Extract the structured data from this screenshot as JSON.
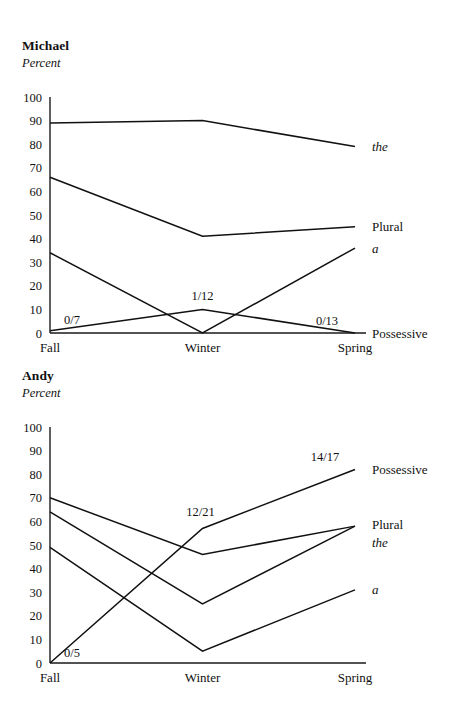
{
  "figure": {
    "panels": [
      {
        "id": "michael",
        "title": "Michael",
        "subtitle": "Percent"
      },
      {
        "id": "andy",
        "title": "Andy",
        "subtitle": "Percent"
      }
    ]
  },
  "chart_data": [
    {
      "type": "line",
      "title": "Michael",
      "subtitle": "Percent",
      "xlabel": "",
      "ylabel": "Percent",
      "categories": [
        "Fall",
        "Winter",
        "Spring"
      ],
      "ylim": [
        0,
        100
      ],
      "yticks": [
        0,
        10,
        20,
        30,
        40,
        50,
        60,
        70,
        80,
        90,
        100
      ],
      "ytick_labels": [
        "0",
        "10",
        "20",
        "30",
        "40",
        "50",
        "60",
        "70",
        "80",
        "90",
        "100"
      ],
      "grid": false,
      "legend_position": "right-inline",
      "series": [
        {
          "name": "the",
          "style": "italic",
          "values": [
            89,
            90,
            79
          ]
        },
        {
          "name": "Plural",
          "style": "roman",
          "values": [
            66,
            41,
            45
          ]
        },
        {
          "name": "a",
          "style": "italic",
          "values": [
            34,
            0,
            36
          ]
        },
        {
          "name": "Possessive",
          "style": "roman",
          "values": [
            1,
            10,
            0
          ]
        }
      ],
      "annotations": [
        {
          "text": "0/7",
          "category": "Fall",
          "value": 1,
          "series": "Possessive"
        },
        {
          "text": "1/12",
          "category": "Winter",
          "value": 10,
          "series": "Possessive"
        },
        {
          "text": "0/13",
          "category": "Spring",
          "value": 0,
          "series": "Possessive"
        }
      ]
    },
    {
      "type": "line",
      "title": "Andy",
      "subtitle": "Percent",
      "xlabel": "",
      "ylabel": "Percent",
      "categories": [
        "Fall",
        "Winter",
        "Spring"
      ],
      "ylim": [
        0,
        100
      ],
      "yticks": [
        0,
        10,
        20,
        30,
        40,
        50,
        60,
        70,
        80,
        90,
        100
      ],
      "ytick_labels": [
        "0",
        "10",
        "20",
        "30",
        "40",
        "50",
        "60",
        "70",
        "80",
        "90",
        "100"
      ],
      "grid": false,
      "legend_position": "right-inline",
      "series": [
        {
          "name": "Possessive",
          "style": "roman",
          "values": [
            0,
            57,
            82
          ]
        },
        {
          "name": "Plural",
          "style": "roman",
          "values": [
            70,
            46,
            58
          ]
        },
        {
          "name": "the",
          "style": "italic",
          "values": [
            64,
            25,
            58
          ]
        },
        {
          "name": "a",
          "style": "italic",
          "values": [
            49,
            5,
            31
          ]
        }
      ],
      "annotations": [
        {
          "text": "0/5",
          "category": "Fall",
          "value": 0,
          "series": "Possessive"
        },
        {
          "text": "12/21",
          "category": "Winter",
          "value": 57,
          "series": "Possessive"
        },
        {
          "text": "14/17",
          "category": "Spring",
          "value": 82,
          "series": "Possessive"
        }
      ]
    }
  ]
}
